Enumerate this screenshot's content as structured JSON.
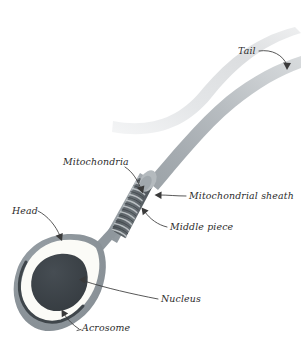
{
  "figure": {
    "background_color": "#ffffff"
  },
  "colors": {
    "tail_faint": "#e9eaec",
    "tail_mid": "#d9dbdd",
    "tail_main": "#a9aeb2",
    "tail_main_light": "#c6cacd",
    "midpiece": "#9aa1a6",
    "sheath_coil": "#5c6368",
    "sheath_collar": "#b9bec2",
    "head_membrane": "#8f979d",
    "acrosome_fill": "#fbfbf7",
    "acrosome_line": "#3f464b",
    "nucleus": "#3a4045",
    "leader_line": "#3a3a3a",
    "label_text": "#2b2b2b"
  },
  "labels": [
    {
      "id": "tail",
      "text": "Tail",
      "x": 238,
      "y": 54,
      "anchor": "start"
    },
    {
      "id": "mitochondria",
      "text": "Mitochondria",
      "x": 63,
      "y": 165,
      "anchor": "start"
    },
    {
      "id": "mitochondrial-sheath",
      "text": "Mitochondrial sheath",
      "x": 189,
      "y": 199,
      "anchor": "start"
    },
    {
      "id": "middle-piece",
      "text": "Middle piece",
      "x": 170,
      "y": 230,
      "anchor": "start"
    },
    {
      "id": "head",
      "text": "Head",
      "x": 12,
      "y": 214,
      "anchor": "start"
    },
    {
      "id": "nucleus",
      "text": "Nucleus",
      "x": 161,
      "y": 302,
      "anchor": "start"
    },
    {
      "id": "acrosome",
      "text": "Acrosome",
      "x": 82,
      "y": 331,
      "anchor": "start"
    }
  ],
  "parts": [
    {
      "id": "tail",
      "name": "Tail"
    },
    {
      "id": "middle-piece",
      "name": "Middle piece"
    },
    {
      "id": "mitochondrial-sheath",
      "name": "Mitochondrial sheath"
    },
    {
      "id": "mitochondria",
      "name": "Mitochondria"
    },
    {
      "id": "head",
      "name": "Head"
    },
    {
      "id": "nucleus",
      "name": "Nucleus"
    },
    {
      "id": "acrosome",
      "name": "Acrosome"
    }
  ]
}
